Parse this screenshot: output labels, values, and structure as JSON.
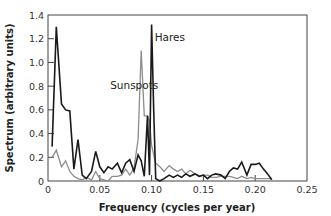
{
  "chart_data": {
    "type": "line",
    "title": "",
    "xlabel": "Frequency (cycles per year)",
    "ylabel": "Spectrum (arbitrary units)",
    "xlim": [
      0,
      0.25
    ],
    "ylim": [
      0,
      1.4
    ],
    "xticks": [
      0,
      0.05,
      0.1,
      0.15,
      0.2,
      0.25
    ],
    "xtick_labels": [
      "0",
      "0.05",
      "0.10",
      "0.15",
      "0.20",
      "0.25"
    ],
    "yticks": [
      0,
      0.2,
      0.4,
      0.6,
      0.8,
      1.0,
      1.2,
      1.4
    ],
    "ytick_labels": [
      "0",
      "0.2",
      "0.4",
      "0.6",
      "0.8",
      "1.0",
      "1.2",
      "1.4"
    ],
    "grid": false,
    "legend": "none (inline annotations)",
    "annotations": [
      {
        "text": "Hares",
        "x": 0.103,
        "y": 1.18
      },
      {
        "text": "Sunspots",
        "x": 0.06,
        "y": 0.78
      }
    ],
    "series": [
      {
        "name": "Hares",
        "color": "#1a1a1a",
        "x": [
          0.004,
          0.008,
          0.013,
          0.017,
          0.021,
          0.025,
          0.029,
          0.033,
          0.037,
          0.042,
          0.046,
          0.05,
          0.054,
          0.058,
          0.062,
          0.067,
          0.071,
          0.075,
          0.079,
          0.083,
          0.087,
          0.09,
          0.093,
          0.096,
          0.098,
          0.1,
          0.102,
          0.104,
          0.108,
          0.112,
          0.117,
          0.121,
          0.125,
          0.129,
          0.133,
          0.137,
          0.142,
          0.146,
          0.15,
          0.154,
          0.158,
          0.162,
          0.167,
          0.171,
          0.175,
          0.179,
          0.183,
          0.187,
          0.192,
          0.196,
          0.2,
          0.204,
          0.208,
          0.212,
          0.216
        ],
        "values": [
          0.29,
          1.3,
          0.65,
          0.6,
          0.59,
          0.1,
          0.35,
          0.05,
          0.02,
          0.08,
          0.25,
          0.12,
          0.07,
          0.12,
          0.1,
          0.15,
          0.07,
          0.15,
          0.18,
          0.08,
          0.22,
          0.17,
          0.04,
          0.55,
          0.05,
          1.32,
          0.6,
          0.02,
          0.0,
          0.02,
          0.05,
          0.03,
          0.05,
          0.03,
          0.06,
          0.04,
          0.06,
          0.04,
          0.05,
          0.02,
          0.05,
          0.06,
          0.05,
          0.02,
          0.08,
          0.11,
          0.1,
          0.16,
          0.05,
          0.14,
          0.14,
          0.15,
          0.1,
          0.06,
          0.01
        ]
      },
      {
        "name": "Sunspots",
        "color": "#8c8c8c",
        "x": [
          0.004,
          0.008,
          0.013,
          0.017,
          0.021,
          0.025,
          0.029,
          0.033,
          0.037,
          0.042,
          0.046,
          0.05,
          0.054,
          0.058,
          0.062,
          0.067,
          0.071,
          0.075,
          0.079,
          0.083,
          0.087,
          0.09,
          0.093,
          0.096,
          0.098,
          0.1,
          0.102,
          0.104,
          0.108,
          0.112,
          0.117,
          0.121,
          0.125,
          0.129,
          0.133,
          0.137,
          0.142,
          0.146,
          0.15,
          0.154,
          0.158,
          0.162,
          0.167,
          0.171,
          0.175,
          0.179,
          0.183,
          0.187,
          0.192,
          0.196,
          0.2,
          0.204,
          0.208,
          0.212,
          0.216
        ],
        "values": [
          0.2,
          0.26,
          0.12,
          0.17,
          0.08,
          0.04,
          0.02,
          0.01,
          0.03,
          0.01,
          0.08,
          0.02,
          0.01,
          0.0,
          0.04,
          0.04,
          0.05,
          0.1,
          0.05,
          0.11,
          0.35,
          1.1,
          0.55,
          0.55,
          0.5,
          0.3,
          0.22,
          0.15,
          0.12,
          0.08,
          0.13,
          0.1,
          0.08,
          0.1,
          0.06,
          0.09,
          0.06,
          0.04,
          0.05,
          0.05,
          0.03,
          0.03,
          0.04,
          0.04,
          0.04,
          0.03,
          0.02,
          0.04,
          0.02,
          0.03,
          0.02,
          0.02,
          0.02,
          0.02,
          0.02
        ]
      }
    ]
  }
}
